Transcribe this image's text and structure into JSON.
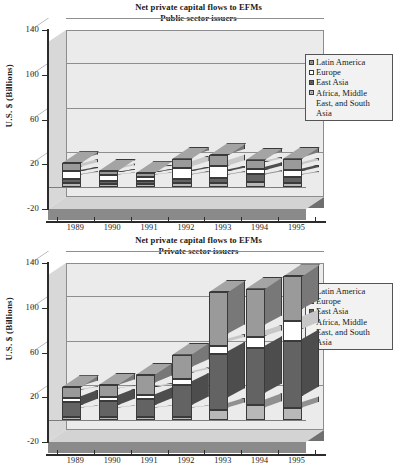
{
  "charts": [
    {
      "id": "public",
      "title_line1": "Net private capital flows to EFMs",
      "title_line2": "Public sector issuers",
      "ylabel": "U.S. $ (Billions)",
      "legend": [
        {
          "name": "Latin America",
          "color": "#9a9a9a"
        },
        {
          "name": "Europe",
          "color": "#ffffff"
        },
        {
          "name": "East Asia",
          "color": "#636363"
        },
        {
          "name": "Africa, Middle\nEast, and South\nAsia",
          "color": "#b8b8b8"
        }
      ],
      "chart_data": {
        "type": "bar",
        "stacked": true,
        "title": "Net private capital flows to EFMs — Public sector issuers",
        "xlabel": "",
        "ylabel": "U.S. $ (Billions)",
        "ylim": [
          -20,
          140
        ],
        "yticks": [
          -20,
          20,
          60,
          100,
          140
        ],
        "grid": true,
        "legend_position": "right",
        "categories": [
          "1989",
          "1990",
          "1991",
          "1992",
          "1993",
          "1994",
          "1995"
        ],
        "series": [
          {
            "name": "Africa, Middle East, and South Asia",
            "color": "#b8b8b8",
            "values": [
              3,
              2,
              2,
              3,
              3,
              4,
              3
            ]
          },
          {
            "name": "East Asia",
            "color": "#636363",
            "values": [
              4,
              3,
              3,
              4,
              5,
              7,
              6
            ]
          },
          {
            "name": "Europe",
            "color": "#ffffff",
            "values": [
              7,
              5,
              4,
              10,
              10,
              5,
              6
            ]
          },
          {
            "name": "Latin America",
            "color": "#9a9a9a",
            "values": [
              7,
              4,
              3,
              8,
              10,
              8,
              10
            ]
          }
        ],
        "totals": [
          21,
          14,
          12,
          25,
          28,
          24,
          25
        ]
      }
    },
    {
      "id": "private",
      "title_line1": "Net private capital flows to EFMs",
      "title_line2": "Private sector issuers",
      "ylabel": "U.S. $ (Billions)",
      "legend": [
        {
          "name": "Latin America",
          "color": "#9a9a9a"
        },
        {
          "name": "Europe",
          "color": "#ffffff"
        },
        {
          "name": "East Asia",
          "color": "#636363"
        },
        {
          "name": "Africa, Middle\nEast, and South\nAsia",
          "color": "#b8b8b8"
        }
      ],
      "chart_data": {
        "type": "bar",
        "stacked": true,
        "title": "Net private capital flows to EFMs — Private sector issuers",
        "xlabel": "",
        "ylabel": "U.S. $ (Billions)",
        "ylim": [
          -20,
          140
        ],
        "yticks": [
          -20,
          20,
          60,
          100,
          140
        ],
        "grid": true,
        "legend_position": "right",
        "categories": [
          "1989",
          "1990",
          "1991",
          "1992",
          "1993",
          "1994",
          "1995"
        ],
        "series": [
          {
            "name": "Africa, Middle East, and South Asia",
            "color": "#b8b8b8",
            "values": [
              2,
              2,
              2,
              2,
              9,
              13,
              10
            ]
          },
          {
            "name": "East Asia",
            "color": "#636363",
            "values": [
              14,
              15,
              16,
              29,
              50,
              51,
              60
            ]
          },
          {
            "name": "Europe",
            "color": "#ffffff",
            "values": [
              3,
              3,
              4,
              5,
              7,
              10,
              18
            ]
          },
          {
            "name": "Latin America",
            "color": "#9a9a9a",
            "values": [
              10,
              11,
              18,
              22,
              48,
              43,
              40
            ]
          }
        ],
        "totals": [
          29,
          31,
          40,
          58,
          114,
          117,
          128
        ]
      }
    }
  ]
}
